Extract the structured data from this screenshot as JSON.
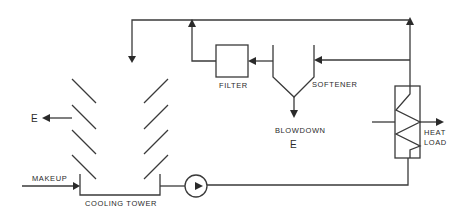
{
  "diagram": {
    "title": "",
    "type": "process flow diagram - cooling water circuit",
    "components": {
      "cooling_tower": {
        "label": "COOLING TOWER"
      },
      "filter": {
        "label": "FILTER"
      },
      "softener": {
        "label": "SOFTENER"
      },
      "heat_exchanger": {
        "label_line1": "HEAT",
        "label_line2": "LOAD"
      },
      "pump": {
        "label": ""
      }
    },
    "streams": {
      "makeup": {
        "label": "MAKEUP"
      },
      "evaporation": {
        "label": "E"
      },
      "blowdown": {
        "label": "BLOWDOWN",
        "sub_label": "E"
      }
    },
    "colors": {
      "line": "#3a3a3a",
      "text": "#2a2a2a",
      "background": "#ffffff"
    }
  }
}
